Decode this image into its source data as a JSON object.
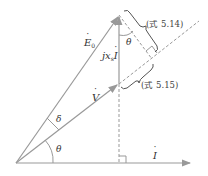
{
  "diagram": {
    "type": "phasor-diagram",
    "colors": {
      "line": "#999999",
      "text": "#333333",
      "background": "#ffffff"
    },
    "vectors": {
      "E0": {
        "label": "E",
        "subscript": "0",
        "dot": true
      },
      "V": {
        "label": "V",
        "dot": true
      },
      "I": {
        "label": "I",
        "dot": true
      },
      "jxsI": {
        "prefix": "jx",
        "subscript": "s",
        "label": "I",
        "dot": true
      }
    },
    "angles": {
      "delta": "δ",
      "theta_bottom": "θ",
      "theta_top": "θ"
    },
    "annotations": {
      "upper_brace": "(式 5.14)",
      "lower_brace": "(式 5.15)"
    }
  }
}
